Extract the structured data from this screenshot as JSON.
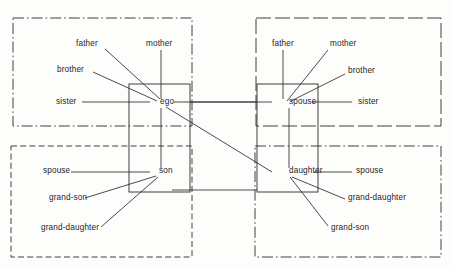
{
  "diagram": {
    "type": "kinship-chart",
    "canvas": {
      "width": 453,
      "height": 269
    },
    "colors": {
      "ink": "#2b2b2b",
      "text": "#1d1d1d",
      "background": "#fdfdfc"
    },
    "nodes": [
      {
        "id": "ego",
        "label": "ego",
        "x": 160,
        "y": 104
      },
      {
        "id": "spouse",
        "label": "spouse",
        "x": 289,
        "y": 104
      },
      {
        "id": "son",
        "label": "son",
        "x": 159,
        "y": 173
      },
      {
        "id": "daughter",
        "label": "daughter",
        "x": 289,
        "y": 173
      }
    ],
    "quadrants": [
      {
        "id": "top-left",
        "name": "ego-family-of-orientation",
        "stroke_style": "dash-dot",
        "x": 13,
        "y": 18,
        "width": 179,
        "height": 108
      },
      {
        "id": "top-right",
        "name": "spouse-family-of-orientation",
        "stroke_style": "long-dash",
        "x": 256,
        "y": 18,
        "width": 185,
        "height": 108
      },
      {
        "id": "bottom-left",
        "name": "son-family-of-procreation",
        "stroke_style": "dashed",
        "x": 11,
        "y": 146,
        "width": 181,
        "height": 111
      },
      {
        "id": "bottom-right",
        "name": "daughter-family-of-procreation",
        "stroke_style": "dash-dot",
        "x": 255,
        "y": 146,
        "width": 186,
        "height": 111
      }
    ],
    "solid_frames": [
      {
        "id": "ego-son-frame",
        "x": 129,
        "y": 84,
        "width": 61,
        "height": 108
      },
      {
        "id": "spouse-daughter-frame",
        "x": 257,
        "y": 84,
        "width": 61,
        "height": 108
      }
    ],
    "labels": {
      "ego_group": [
        {
          "text": "father",
          "x": 76,
          "y": 46,
          "anchor": "start"
        },
        {
          "text": "mother",
          "x": 146,
          "y": 46,
          "anchor": "start"
        },
        {
          "text": "brother",
          "x": 57,
          "y": 72,
          "anchor": "start"
        },
        {
          "text": "sister",
          "x": 56,
          "y": 104,
          "anchor": "start"
        }
      ],
      "spouse_group": [
        {
          "text": "father",
          "x": 272,
          "y": 46,
          "anchor": "start"
        },
        {
          "text": "mother",
          "x": 330,
          "y": 46,
          "anchor": "start"
        },
        {
          "text": "brother",
          "x": 348,
          "y": 73,
          "anchor": "start"
        },
        {
          "text": "sister",
          "x": 358,
          "y": 104,
          "anchor": "start"
        }
      ],
      "son_group": [
        {
          "text": "spouse",
          "x": 43,
          "y": 173,
          "anchor": "start"
        },
        {
          "text": "grand-son",
          "x": 49,
          "y": 200,
          "anchor": "start"
        },
        {
          "text": "grand-daughter",
          "x": 41,
          "y": 230,
          "anchor": "start"
        }
      ],
      "daughter_group": [
        {
          "text": "spouse",
          "x": 356,
          "y": 173,
          "anchor": "start"
        },
        {
          "text": "grand-daughter",
          "x": 348,
          "y": 200,
          "anchor": "start"
        },
        {
          "text": "grand-son",
          "x": 331,
          "y": 230,
          "anchor": "start"
        }
      ]
    },
    "connectors": [
      {
        "from": "father-ego",
        "d": "M 105 49 L 160 99"
      },
      {
        "from": "mother-ego",
        "d": "M 161 50 L 161 99"
      },
      {
        "from": "brother-ego",
        "d": "M 93 72 L 157 101"
      },
      {
        "from": "sister-ego",
        "d": "M 82 102 L 150 102"
      },
      {
        "from": "ego-son-vertical",
        "d": "M 161 108 L 161 168"
      },
      {
        "from": "ego-daughter-diagonal",
        "d": "M 166 107 L 272 172"
      },
      {
        "from": "ego-spouse-horizontal",
        "d": "M 174 102 L 272 102"
      },
      {
        "from": "father-spouse",
        "d": "M 283 50 L 283 99"
      },
      {
        "from": "mother-spouse",
        "d": "M 328 50 L 287 101"
      },
      {
        "from": "brother-spouse",
        "d": "M 345 74 L 291 101"
      },
      {
        "from": "sister-spouse",
        "d": "M 352 102 L 312 102"
      },
      {
        "from": "spouse-daughter-vertical",
        "d": "M 289 108 L 289 168"
      },
      {
        "from": "spouse-son-horizontal",
        "d": "M 190 102 L 257 102"
      },
      {
        "from": "son-spouse-horizontal",
        "d": "M 71 172 L 150 172"
      },
      {
        "from": "son-grandson",
        "d": "M 85 198 L 156 176"
      },
      {
        "from": "son-granddaughter",
        "d": "M 101 227 L 158 177"
      },
      {
        "from": "daughter-spouse",
        "d": "M 314 172 L 352 172"
      },
      {
        "from": "daughter-granddaughter",
        "d": "M 345 199 L 292 177"
      },
      {
        "from": "daughter-grandson",
        "d": "M 328 226 L 290 177"
      },
      {
        "from": "son-daughter-horizontal",
        "d": "M 172 190 L 257 190"
      }
    ]
  }
}
